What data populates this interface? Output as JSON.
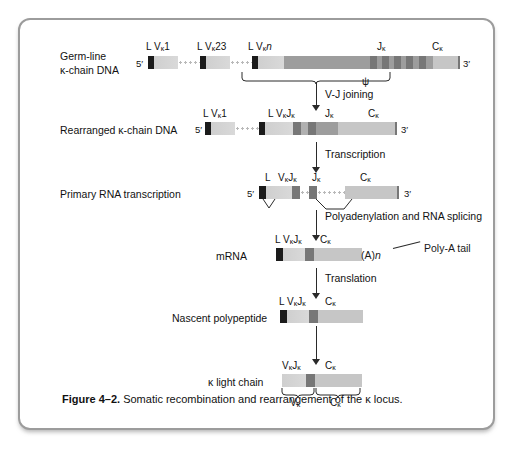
{
  "figure": {
    "caption_label": "Figure 4–2.",
    "caption_text": "Somatic recombination and rearrangement of the κ locus."
  },
  "rows": {
    "germline": {
      "label_line1": "Germ-line",
      "label_line2": "κ-chain DNA",
      "five_prime": "5′",
      "three_prime": "3′",
      "marks": [
        "L  Vκ1",
        "L Vκ23",
        "L  Vκn",
        "Jκ",
        "Cκ"
      ],
      "pseudogene": "ψ"
    },
    "rearranged": {
      "label": "Rearranged κ-chain DNA",
      "five_prime": "5′",
      "three_prime": "3′",
      "marks": [
        "L  Vκ1",
        "L   VκJκ",
        "Jκ",
        "Cκ"
      ]
    },
    "primary_rna": {
      "label": "Primary RNA transcription",
      "five_prime": "5′",
      "three_prime": "3′",
      "marks": [
        "L",
        "VκJκ",
        "Jκ",
        "Cκ"
      ]
    },
    "mrna": {
      "label": "mRNA",
      "marks": [
        "L VκJκ",
        "Cκ"
      ],
      "polyA_value": "(A)n",
      "polyA_annotation": "Poly-A tail"
    },
    "polypeptide": {
      "label": "Nascent polypeptide",
      "marks": [
        "L VκJκ",
        "Cκ"
      ]
    },
    "light_chain": {
      "label": "κ light chain",
      "marks": [
        "VκJκ",
        "Cκ"
      ],
      "brace_left": "Vκ",
      "brace_right": "Cκ"
    }
  },
  "steps": {
    "vj_joining": "V-J joining",
    "transcription": "Transcription",
    "polyadenylation": "Polyadenylation and RNA splicing",
    "translation": "Translation"
  },
  "colors": {
    "leader": "#1b1b1b",
    "v_segment": "#d4d4d4",
    "j_segment": "#8e8e8e",
    "c_segment": "#c6c6c6",
    "intergenic": "#9d9d9d",
    "border": "#9c9c9c",
    "text": "#1a1a1a"
  }
}
